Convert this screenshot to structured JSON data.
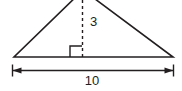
{
  "figure": {
    "kind": "geometry-diagram",
    "background_color": "#ffffff",
    "stroke_color": "#231f20",
    "text_color": "#231f20",
    "triangle": {
      "name": "triangle-outline",
      "apex": {
        "x": 83,
        "y": -10
      },
      "left_vertex": {
        "x": 14,
        "y": 57
      },
      "right_vertex": {
        "x": 173,
        "y": 57
      },
      "fill": "none",
      "stroke_width": 1.6,
      "apex_cropped_at_top": true
    },
    "altitude": {
      "name": "altitude-dashed-line",
      "x": 82.5,
      "y_top": 0,
      "y_bottom": 57,
      "style": "dashed",
      "dash_pattern": "3 3",
      "stroke_width": 1.4,
      "label": "3",
      "label_x": 90,
      "label_y": 23
    },
    "right_angle": {
      "name": "right-angle-marker",
      "x_left": 70,
      "x_right": 82,
      "y_top": 46,
      "y_bottom": 57,
      "side": "left-of-altitude",
      "stroke_width": 1.4
    },
    "base_dimension": {
      "name": "base-dimension",
      "y": 70.5,
      "x_start": 12.5,
      "x_end": 173.5,
      "tick_half_height": 6,
      "arrowheads": "both",
      "label": "10",
      "label_x": 92,
      "label_y": 82,
      "stroke_width": 1.3
    }
  }
}
